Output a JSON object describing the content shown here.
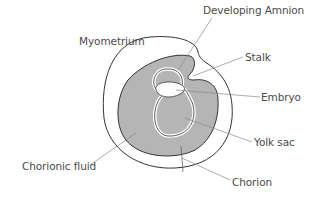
{
  "diagram": {
    "colors": {
      "background": "#ffffff",
      "outline": "#333333",
      "fill": "#b5b5b5",
      "leader": "#8a8a8a",
      "text": "#4a4a4a"
    },
    "labels": {
      "developing_amnion": "Developing Amnion",
      "myometrium": "Myometrium",
      "stalk": "Stalk",
      "embryo": "Embryo",
      "yolk_sac": "Yolk sac",
      "chorionic_fluid": "Chorionic fluid",
      "chorion": "Chorion"
    }
  }
}
